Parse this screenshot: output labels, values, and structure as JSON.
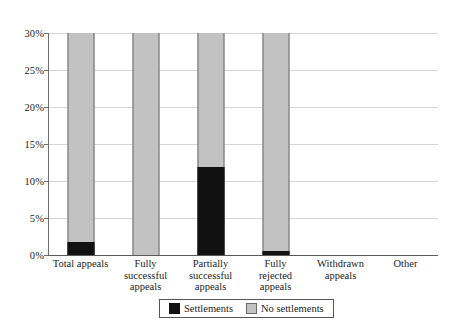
{
  "chart_data": {
    "type": "bar",
    "stacked": true,
    "title": "",
    "xlabel": "",
    "ylabel": "",
    "ylim": [
      0,
      30
    ],
    "ytick_labels": [
      "0%",
      "5%",
      "10%",
      "15%",
      "20%",
      "25%",
      "30%"
    ],
    "ytick_values": [
      0,
      5,
      10,
      15,
      20,
      25,
      30
    ],
    "grid": true,
    "legend_position": "bottom-center",
    "categories": [
      "Total appeals",
      "Fully successful appeals",
      "Partially successful appeals",
      "Fully rejected appeals",
      "Withdrawn appeals",
      "Other"
    ],
    "category_lines": [
      [
        "Total appeals"
      ],
      [
        "Fully",
        "successful",
        "appeals"
      ],
      [
        "Partially",
        "successful",
        "appeals"
      ],
      [
        "Fully",
        "rejected",
        "appeals"
      ],
      [
        "Withdrawn",
        "appeals"
      ],
      [
        "Other"
      ]
    ],
    "series": [
      {
        "name": "Settlements",
        "color": "#111111",
        "values": [
          1.7,
          0,
          11.9,
          0.5,
          0,
          0
        ]
      },
      {
        "name": "No settlements",
        "color": "#c2c2c2",
        "values": [
          28.3,
          30,
          18.1,
          29.5,
          0,
          0
        ]
      }
    ],
    "bar_totals": [
      30,
      30,
      30,
      30,
      0,
      0
    ],
    "note_clipped_at_max": true
  },
  "legend": {
    "items": [
      {
        "label": "Settlements",
        "swatch": "black-square-swatch"
      },
      {
        "label": "No settlements",
        "swatch": "gray-square-swatch"
      }
    ]
  }
}
